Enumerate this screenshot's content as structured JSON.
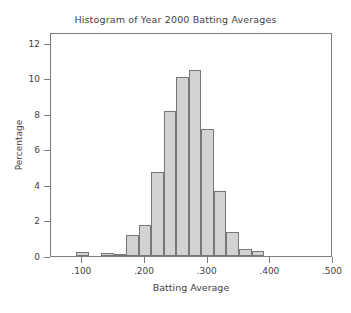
{
  "chart_data": {
    "type": "bar",
    "title": "Histogram of Year 2000 Batting Averages",
    "xlabel": "Batting Average",
    "ylabel": "Percentage",
    "xlim": [
      0.05,
      0.5
    ],
    "ylim": [
      0,
      12.6
    ],
    "grid": false,
    "legend": null,
    "bin_width": 0.02,
    "xticks": [
      0.1,
      0.2,
      0.3,
      0.4,
      0.5
    ],
    "xtick_labels": [
      ".100",
      ".200",
      ".300",
      ".400",
      ".500"
    ],
    "yticks": [
      0,
      2,
      4,
      6,
      8,
      10,
      12
    ],
    "ytick_labels": [
      "0",
      "2",
      "4",
      "6",
      "8",
      "10",
      "12"
    ],
    "bin_starts": [
      0.09,
      0.13,
      0.15,
      0.17,
      0.19,
      0.21,
      0.23,
      0.25,
      0.27,
      0.29,
      0.31,
      0.33,
      0.35,
      0.37
    ],
    "bin_centers": [
      0.1,
      0.14,
      0.16,
      0.18,
      0.2,
      0.22,
      0.24,
      0.26,
      0.28,
      0.3,
      0.32,
      0.34,
      0.36,
      0.38
    ],
    "values": [
      0.2,
      0.15,
      0.1,
      1.2,
      1.75,
      4.7,
      8.15,
      10.05,
      10.45,
      7.15,
      3.65,
      1.35,
      0.4,
      0.3
    ],
    "bar_fill_color": "#d2d2d2",
    "bar_border_color": "#777777",
    "axis_color": "#7d7d7d",
    "text_color": "#3f3f3f",
    "background_color": "#ffffff"
  }
}
